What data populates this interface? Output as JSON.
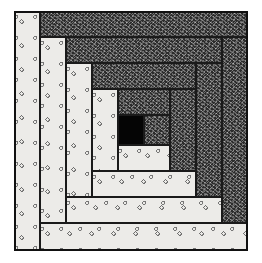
{
  "image": {
    "subject": "Log cabin quilt block illustration",
    "colors": {
      "light_fabric": "#ecebe8",
      "dark_fabric": "#2c2c2c",
      "center_square": "#050505",
      "outline": "#1a1a1a"
    }
  },
  "quilt": {
    "center": {
      "x": 118,
      "y": 115,
      "w": 26,
      "h": 30,
      "fill": "center"
    },
    "rings": [
      {
        "name": "ring-1",
        "left": {
          "x": 92,
          "y": 89,
          "w": 26,
          "h": 82,
          "fill": "light"
        },
        "top": {
          "x": 118,
          "y": 89,
          "w": 52,
          "h": 26,
          "fill": "dark"
        },
        "right": {
          "x": 144,
          "y": 115,
          "w": 26,
          "h": 30,
          "fill": "dark"
        },
        "bottom": {
          "x": 118,
          "y": 145,
          "w": 52,
          "h": 26,
          "fill": "light"
        }
      },
      {
        "name": "ring-2",
        "left": {
          "x": 66,
          "y": 63,
          "w": 26,
          "h": 134,
          "fill": "light"
        },
        "top": {
          "x": 92,
          "y": 63,
          "w": 104,
          "h": 26,
          "fill": "dark"
        },
        "right": {
          "x": 170,
          "y": 89,
          "w": 26,
          "h": 82,
          "fill": "dark"
        },
        "bottom": {
          "x": 92,
          "y": 171,
          "w": 104,
          "h": 26,
          "fill": "light"
        }
      },
      {
        "name": "ring-3",
        "left": {
          "x": 40,
          "y": 37,
          "w": 26,
          "h": 186,
          "fill": "light"
        },
        "top": {
          "x": 66,
          "y": 37,
          "w": 156,
          "h": 26,
          "fill": "dark"
        },
        "right": {
          "x": 196,
          "y": 63,
          "w": 26,
          "h": 134,
          "fill": "dark"
        },
        "bottom": {
          "x": 66,
          "y": 197,
          "w": 156,
          "h": 26,
          "fill": "light"
        }
      },
      {
        "name": "ring-4",
        "left": {
          "x": 14,
          "y": 11,
          "w": 26,
          "h": 240,
          "fill": "light"
        },
        "top": {
          "x": 40,
          "y": 11,
          "w": 208,
          "h": 26,
          "fill": "dark"
        },
        "right": {
          "x": 222,
          "y": 37,
          "w": 26,
          "h": 186,
          "fill": "dark"
        },
        "bottom": {
          "x": 40,
          "y": 223,
          "w": 208,
          "h": 28,
          "fill": "light"
        }
      }
    ]
  }
}
